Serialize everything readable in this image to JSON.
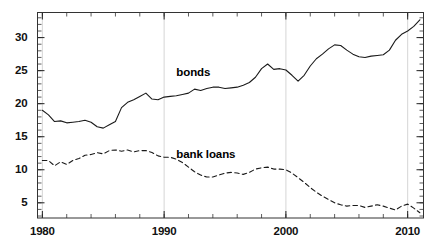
{
  "chart_data": {
    "type": "line",
    "title": "",
    "subtitle": "",
    "xlabel": "",
    "ylabel": "",
    "xlim": [
      1979.6,
      2011.3
    ],
    "ylim": [
      2.7,
      33.8
    ],
    "x_ticks": [
      1980,
      1990,
      2000,
      2010
    ],
    "x_tick_labels": [
      "1980",
      "1990",
      "2000",
      "2010"
    ],
    "x_minor_tick_interval": 2,
    "y_ticks": [
      5,
      10,
      15,
      20,
      25,
      30
    ],
    "y_tick_labels": [
      "5",
      "10",
      "15",
      "20",
      "25",
      "30"
    ],
    "y_minor_tick_interval": 1,
    "grid": true,
    "grid_axis": "x",
    "grid_color": "#cccccc",
    "grid_x_values": [
      1980,
      1990,
      2000,
      2010
    ],
    "legend": "inline-annotations",
    "annotations": [
      {
        "text": "bonds",
        "x": 1993.3,
        "y": 24.5
      },
      {
        "text": "bank loans",
        "x": 1993.3,
        "y": 12.1
      }
    ],
    "series": [
      {
        "name": "bonds",
        "color": "#1a1a1a",
        "style": "solid",
        "x": [
          1980.0,
          1980.5,
          1981.0,
          1981.5,
          1982.0,
          1982.5,
          1983.0,
          1983.5,
          1984.0,
          1984.5,
          1985.0,
          1985.5,
          1986.0,
          1986.5,
          1987.0,
          1987.5,
          1988.0,
          1988.5,
          1989.0,
          1989.5,
          1990.0,
          1990.5,
          1991.0,
          1991.5,
          1992.0,
          1992.5,
          1993.0,
          1993.5,
          1994.0,
          1994.5,
          1995.0,
          1995.5,
          1996.0,
          1996.5,
          1997.0,
          1997.5,
          1998.0,
          1998.5,
          1999.0,
          1999.5,
          2000.0,
          2000.5,
          2001.0,
          2001.5,
          2002.0,
          2002.5,
          2003.0,
          2003.5,
          2004.0,
          2004.5,
          2005.0,
          2005.5,
          2006.0,
          2006.5,
          2007.0,
          2007.5,
          2008.0,
          2008.5,
          2009.0,
          2009.5,
          2010.0,
          2010.5,
          2011.0
        ],
        "y": [
          19.0,
          18.3,
          17.3,
          17.4,
          17.1,
          17.2,
          17.3,
          17.5,
          17.2,
          16.5,
          16.3,
          16.8,
          17.3,
          19.4,
          20.2,
          20.6,
          21.1,
          21.6,
          20.7,
          20.6,
          21.0,
          21.1,
          21.2,
          21.4,
          21.6,
          22.2,
          22.0,
          22.3,
          22.5,
          22.5,
          22.3,
          22.4,
          22.5,
          22.8,
          23.2,
          24.0,
          25.3,
          26.0,
          25.2,
          25.3,
          25.1,
          24.3,
          23.4,
          24.3,
          25.7,
          26.8,
          27.5,
          28.3,
          28.9,
          28.8,
          28.1,
          27.5,
          27.1,
          27.0,
          27.2,
          27.3,
          27.4,
          28.1,
          29.6,
          30.5,
          31.0,
          31.7,
          32.7
        ]
      },
      {
        "name": "bank loans",
        "color": "#1a1a1a",
        "style": "dashed",
        "x": [
          1980.0,
          1980.5,
          1981.0,
          1981.5,
          1982.0,
          1982.5,
          1983.0,
          1983.5,
          1984.0,
          1984.5,
          1985.0,
          1985.5,
          1986.0,
          1986.5,
          1987.0,
          1987.5,
          1988.0,
          1988.5,
          1989.0,
          1989.5,
          1990.0,
          1990.5,
          1991.0,
          1991.5,
          1992.0,
          1992.5,
          1993.0,
          1993.5,
          1994.0,
          1994.5,
          1995.0,
          1995.5,
          1996.0,
          1996.5,
          1997.0,
          1997.5,
          1998.0,
          1998.5,
          1999.0,
          1999.5,
          2000.0,
          2000.5,
          2001.0,
          2001.5,
          2002.0,
          2002.5,
          2003.0,
          2003.5,
          2004.0,
          2004.5,
          2005.0,
          2005.5,
          2006.0,
          2006.5,
          2007.0,
          2007.5,
          2008.0,
          2008.5,
          2009.0,
          2009.5,
          2010.0,
          2010.5,
          2011.0
        ],
        "y": [
          11.4,
          11.4,
          10.6,
          11.2,
          10.8,
          11.4,
          11.7,
          12.2,
          12.3,
          12.6,
          12.4,
          12.9,
          13.0,
          12.8,
          13.0,
          12.7,
          12.9,
          12.9,
          12.6,
          12.1,
          11.9,
          11.9,
          11.6,
          11.1,
          10.4,
          9.7,
          9.2,
          8.9,
          8.9,
          9.2,
          9.5,
          9.6,
          9.5,
          9.3,
          9.6,
          10.1,
          10.3,
          10.4,
          10.1,
          10.1,
          10.0,
          9.5,
          8.8,
          8.1,
          7.3,
          6.6,
          6.0,
          5.5,
          5.0,
          4.7,
          4.5,
          4.6,
          4.6,
          4.3,
          4.5,
          4.7,
          4.5,
          4.2,
          3.9,
          4.5,
          4.8,
          4.2,
          3.5
        ]
      }
    ]
  }
}
